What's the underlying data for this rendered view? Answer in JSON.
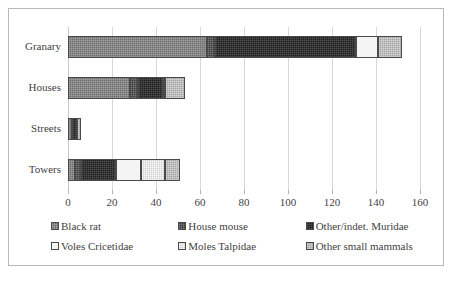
{
  "chart_data": {
    "type": "bar",
    "orientation": "horizontal",
    "stacked": true,
    "title": "",
    "subtitle": "",
    "xlabel": "",
    "ylabel": "",
    "xlim": [
      0,
      160
    ],
    "ylim": null,
    "grid": true,
    "grid_axis": "x",
    "legend_position": "bottom",
    "categories": [
      "Granary",
      "Houses",
      "Streets",
      "Towers"
    ],
    "xticks": [
      0,
      20,
      40,
      60,
      80,
      100,
      120,
      140,
      160
    ],
    "xtick_labels": [
      "0",
      "20",
      "40",
      "60",
      "80",
      "100",
      "120",
      "140",
      "160"
    ],
    "series": [
      {
        "name": "Black rat",
        "color": "#6e6e6e",
        "values": [
          63,
          28,
          2,
          3
        ]
      },
      {
        "name": "House mouse",
        "color": "#3c3c3c",
        "values": [
          4,
          4,
          0,
          3
        ]
      },
      {
        "name": "Other/indet. Muridae",
        "color": "#212121",
        "values": [
          64,
          11,
          2,
          16
        ]
      },
      {
        "name": "Voles Cricetidae",
        "color": "#f4f4f4",
        "values": [
          10,
          0,
          0,
          11
        ]
      },
      {
        "name": "Moles Talpidae",
        "color": "#cfcfcf",
        "values": [
          0,
          1,
          0,
          11
        ]
      },
      {
        "name": "Other small mammals",
        "color": "#a6a6a6",
        "values": [
          11,
          9,
          2,
          7
        ]
      }
    ],
    "totals": [
      152,
      53,
      6,
      51
    ]
  },
  "legend": {
    "items": [
      {
        "label": "Black rat",
        "swatch": "blackrat"
      },
      {
        "label": "House mouse",
        "swatch": "housemouse"
      },
      {
        "label": "Other/indet. Muridae",
        "swatch": "muridae"
      },
      {
        "label": "Voles Cricetidae",
        "swatch": "voles"
      },
      {
        "label": "Moles Talpidae",
        "swatch": "moles"
      },
      {
        "label": "Other small mammals",
        "swatch": "othersmall"
      }
    ]
  },
  "axis": {
    "x_min_label": "0",
    "x_max_label": "160"
  }
}
